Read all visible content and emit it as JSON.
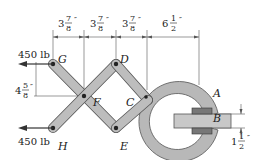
{
  "diagram": {
    "type": "scissor-linkage clamp",
    "forces": [
      {
        "id": "force-G",
        "label": "450 lb",
        "point": "G",
        "direction": "left"
      },
      {
        "id": "force-H",
        "label": "450 lb",
        "point": "H",
        "direction": "left"
      }
    ],
    "points": {
      "G": "G",
      "D": "D",
      "F": "F",
      "C": "C",
      "H": "H",
      "E": "E",
      "A": "A",
      "B": "B"
    },
    "dimensions": {
      "d1": {
        "whole": "3",
        "num": "7",
        "den": "8",
        "unit": "″"
      },
      "d2": {
        "whole": "3",
        "num": "7",
        "den": "8",
        "unit": "″"
      },
      "d3": {
        "whole": "3",
        "num": "7",
        "den": "8",
        "unit": "″"
      },
      "d4": {
        "whole": "6",
        "num": "1",
        "den": "2",
        "unit": "″"
      },
      "vertical": {
        "whole": "4",
        "num": "5",
        "den": "8",
        "unit": "″"
      },
      "thickness": {
        "whole": "1",
        "num": "1",
        "den": "2",
        "unit": "″"
      }
    },
    "colors": {
      "link_fill": "#bdbdbd",
      "link_stroke": "#555555",
      "clamp_fill": "#b8b8b8",
      "bar_fill": "#c8c8c8",
      "line": "#333333"
    }
  }
}
